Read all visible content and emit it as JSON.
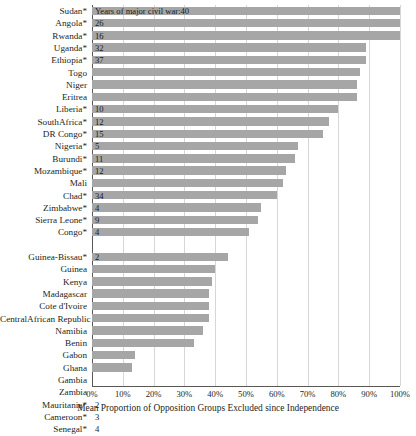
{
  "chart_data": {
    "type": "bar",
    "orientation": "horizontal",
    "title": "",
    "xlabel": "Mean Proportion of Opposition Groups Excluded since Independence",
    "ylabel": "",
    "xlim": [
      0,
      100
    ],
    "xtick_labels": [
      "0%",
      "10%",
      "20%",
      "30%",
      "40%",
      "50%",
      "60%",
      "70%",
      "80%",
      "90%",
      "100%"
    ],
    "xtick_values": [
      0,
      10,
      20,
      30,
      40,
      50,
      60,
      70,
      80,
      90,
      100
    ],
    "grid": true,
    "legend": "none",
    "annotation": "Years of major civil war:40",
    "value_series_name": "Years of major civil war",
    "categories": [
      "Sudan*",
      "Angola*",
      "Rwanda*",
      "Uganda*",
      "Ethiopia*",
      "Togo",
      "Niger",
      "Eritrea",
      "Liberia*",
      "SouthAfrica*",
      "DR Congo*",
      "Nigeria*",
      "Burundi*",
      "Mozambique*",
      "Mali",
      "Chad*",
      "Zimbabwe*",
      "Sierra Leone*",
      "Congo*",
      "",
      "Guinea-Bissau*",
      "Guinea",
      "Kenya",
      "Madagascar",
      "Cote d'Ivoire",
      "CentralAfrican Republic",
      "Namibia",
      "Benin",
      "Gabon",
      "Ghana",
      "Gambia",
      "Zambia",
      "Mauritania*",
      "Cameroon*",
      "Senegal*"
    ],
    "values": [
      100,
      100,
      100,
      89,
      89,
      87,
      86,
      86,
      80,
      77,
      75,
      67,
      66,
      63,
      62,
      60,
      55,
      54,
      51,
      null,
      44,
      40,
      39,
      38,
      38,
      38,
      36,
      33,
      14,
      13,
      0,
      0,
      0,
      0,
      0
    ],
    "years_of_civil_war": [
      "40",
      "26",
      "16",
      "32",
      "37",
      "",
      "",
      "",
      "10",
      "12",
      "15",
      "5",
      "11",
      "12",
      "",
      "34",
      "4",
      "9",
      "4",
      "",
      "2",
      "",
      "",
      "",
      "",
      "",
      "",
      "",
      "",
      "",
      "",
      "",
      "2",
      "3",
      "4"
    ]
  }
}
